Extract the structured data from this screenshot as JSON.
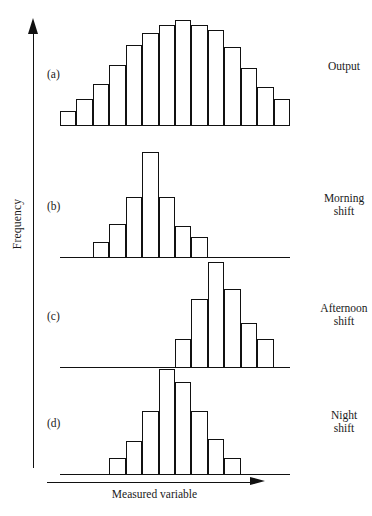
{
  "figure": {
    "axes": {
      "y_label": "Frequency",
      "x_label": "Measured variable",
      "y_arrow_icon": "up-arrow-icon",
      "x_arrow_icon": "right-arrow-icon"
    }
  },
  "chart_data": [
    {
      "type": "bar",
      "panel": "a",
      "panel_letter": "(a)",
      "title": "Output",
      "xlabel": "Measured variable",
      "ylabel": "Frequency",
      "grid": false,
      "legend": "none",
      "bin_count": 13,
      "bin_start": 0,
      "categories": [
        "1",
        "2",
        "3",
        "4",
        "5",
        "6",
        "7",
        "8",
        "9",
        "10",
        "11",
        "12",
        "13"
      ],
      "values": [
        13,
        24,
        38,
        55,
        73,
        84,
        92,
        96,
        92,
        87,
        72,
        52,
        35,
        24
      ],
      "ylim": [
        0,
        100
      ]
    },
    {
      "type": "bar",
      "panel": "b",
      "panel_letter": "(b)",
      "title": "Morning\nshift",
      "xlabel": "Measured variable",
      "ylabel": "Frequency",
      "grid": false,
      "legend": "none",
      "bin_count": 7,
      "bin_start": 2,
      "categories": [
        "2",
        "3",
        "4",
        "5",
        "6",
        "7",
        "8"
      ],
      "values": [
        14,
        30,
        55,
        96,
        55,
        28,
        18
      ],
      "ylim": [
        0,
        100
      ]
    },
    {
      "type": "bar",
      "panel": "c",
      "panel_letter": "(c)",
      "title": "Afternoon\nshift",
      "xlabel": "Measured variable",
      "ylabel": "Frequency",
      "grid": false,
      "legend": "none",
      "bin_count": 6,
      "bin_start": 7,
      "categories": [
        "7",
        "8",
        "9",
        "10",
        "11",
        "12"
      ],
      "values": [
        26,
        62,
        96,
        72,
        40,
        26
      ],
      "ylim": [
        0,
        100
      ]
    },
    {
      "type": "bar",
      "panel": "d",
      "panel_letter": "(d)",
      "title": "Night\nshift",
      "xlabel": "Measured variable",
      "ylabel": "Frequency",
      "grid": false,
      "legend": "none",
      "bin_count": 8,
      "bin_start": 3,
      "categories": [
        "3",
        "4",
        "5",
        "6",
        "7",
        "8",
        "9",
        "10"
      ],
      "values": [
        15,
        30,
        58,
        96,
        84,
        58,
        32,
        15
      ],
      "ylim": [
        0,
        100
      ]
    }
  ],
  "style": {
    "stroke_color": "#111111",
    "fill_color": "#ffffff",
    "background": "#ffffff"
  }
}
